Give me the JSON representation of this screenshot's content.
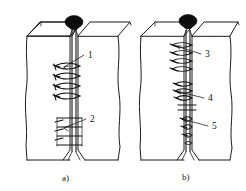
{
  "figure": {
    "background_color": "#ffffff",
    "line_color": "#1c1c1c",
    "node_color": "#0d0d0d",
    "width": 246,
    "height": 191
  },
  "panels": [
    {
      "id": "panel-a",
      "caption": "a)",
      "caption_x": 62,
      "caption_y": 181,
      "callouts": [
        {
          "label": "1",
          "x": 88,
          "y": 58,
          "leader_from_x": 84,
          "leader_from_y": 55,
          "leader_to_x": 64,
          "leader_to_y": 67
        },
        {
          "label": "2",
          "x": 90,
          "y": 122,
          "leader_from_x": 86,
          "leader_from_y": 119,
          "leader_to_x": 64,
          "leader_to_y": 128
        }
      ]
    },
    {
      "id": "panel-b",
      "caption": "b)",
      "caption_x": 182,
      "caption_y": 180,
      "callouts": [
        {
          "label": "3",
          "x": 205,
          "y": 57,
          "leader_from_x": 201,
          "leader_from_y": 54,
          "leader_to_x": 176,
          "leader_to_y": 46
        },
        {
          "label": "4",
          "x": 208,
          "y": 101,
          "leader_from_x": 204,
          "leader_from_y": 98,
          "leader_to_x": 176,
          "leader_to_y": 91
        },
        {
          "label": "5",
          "x": 212,
          "y": 129,
          "leader_from_x": 208,
          "leader_from_y": 126,
          "leader_to_x": 182,
          "leader_to_y": 119
        }
      ]
    }
  ],
  "legend_items": [
    {
      "number": "1",
      "meaning": ""
    },
    {
      "number": "2",
      "meaning": ""
    },
    {
      "number": "3",
      "meaning": ""
    },
    {
      "number": "4",
      "meaning": ""
    },
    {
      "number": "5",
      "meaning": ""
    }
  ]
}
